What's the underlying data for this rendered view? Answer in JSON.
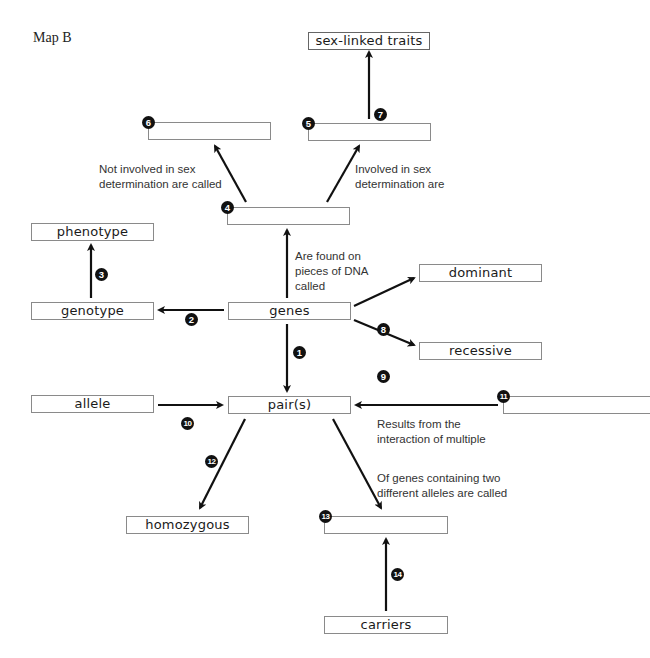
{
  "title": "Map B",
  "boxes": {
    "sex_linked_traits": "sex-linked traits",
    "box5": "",
    "box6": "",
    "box4": "",
    "phenotype": "phenotype",
    "genotype": "genotype",
    "genes": "genes",
    "dominant": "dominant",
    "recessive": "recessive",
    "allele": "allele",
    "pairs": "pair(s)",
    "box11": "",
    "homozygous": "homozygous",
    "box13": "",
    "carriers": "carriers"
  },
  "badges": {
    "n1": "1",
    "n2": "2",
    "n3": "3",
    "n4": "4",
    "n5": "5",
    "n6": "6",
    "n7": "7",
    "n8": "8",
    "n9": "9",
    "n10": "10",
    "n11": "11",
    "n12": "12",
    "n13": "13",
    "n14": "14"
  },
  "labels": {
    "not_involved_line1": "Not involved in sex",
    "not_involved_line2": "determination are called",
    "involved_line1": "Involved in sex",
    "involved_line2": "determination are",
    "found_on_line1": "Are found on",
    "found_on_line2": "pieces of DNA",
    "found_on_line3": "called",
    "results_line1": "Results from the",
    "results_line2": "interaction of multiple",
    "of_genes_line1": "Of genes containing two",
    "of_genes_line2": "different alleles are called"
  },
  "colors": {
    "arrow": "#111111",
    "box_border": "#8a8a8a",
    "badge": "#111111"
  }
}
